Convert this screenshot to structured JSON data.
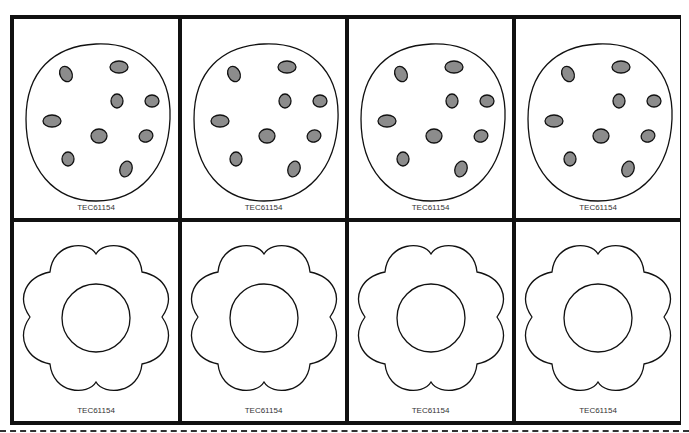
{
  "sheet": {
    "rows": [
      {
        "shape": "cookie",
        "cards": [
          {
            "label": "TEC61154"
          },
          {
            "label": "TEC61154"
          },
          {
            "label": "TEC61154"
          },
          {
            "label": "TEC61154"
          }
        ]
      },
      {
        "shape": "flower",
        "cards": [
          {
            "label": "TEC61154"
          },
          {
            "label": "TEC61154"
          },
          {
            "label": "TEC61154"
          },
          {
            "label": "TEC61154"
          }
        ]
      }
    ],
    "colors": {
      "border": "#111111",
      "chip_fill": "#8c8c8c",
      "outline": "#111111"
    },
    "cut_line": "dashed"
  }
}
